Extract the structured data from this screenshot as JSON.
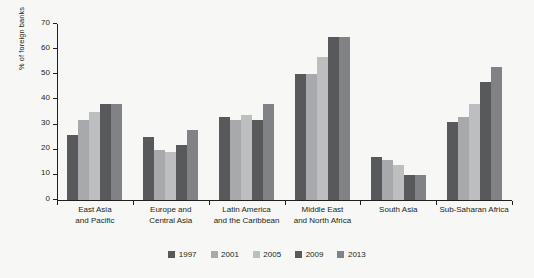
{
  "figure": {
    "title_remnant": "",
    "background_color": "#f7f7f5"
  },
  "chart_data": {
    "type": "bar",
    "title": "",
    "subtitle": "",
    "xlabel": "",
    "ylabel": "% of foreign banks",
    "ylim": [
      0,
      70
    ],
    "yticks": [
      0,
      10,
      20,
      30,
      40,
      50,
      60,
      70
    ],
    "grid": false,
    "legend_position": "bottom-center",
    "orientation": "vertical",
    "grouped": true,
    "categories": [
      "East Asia and Pacific",
      "Europe and Central Asia",
      "Latin America and the Caribbean",
      "Middle East and North Africa",
      "South Asia",
      "Sub-Saharan Africa"
    ],
    "category_lines": [
      [
        "East Asia",
        "and Pacific"
      ],
      [
        "Europe and",
        "Central Asia"
      ],
      [
        "Latin America",
        "and the Caribbean"
      ],
      [
        "Middle East",
        "and North Africa"
      ],
      [
        "South Asia",
        ""
      ],
      [
        "Sub-Saharan Africa",
        ""
      ]
    ],
    "series": [
      {
        "name": "1997",
        "color": "#58595b",
        "values": [
          26,
          25,
          33,
          50,
          17,
          31
        ]
      },
      {
        "name": "2001",
        "color": "#a7a9ac",
        "values": [
          32,
          20,
          32,
          50,
          16,
          33
        ]
      },
      {
        "name": "2005",
        "color": "#bcbec0",
        "values": [
          35,
          19,
          34,
          57,
          14,
          38
        ]
      },
      {
        "name": "2009",
        "color": "#58595b",
        "values": [
          38,
          22,
          32,
          65,
          10,
          47
        ]
      },
      {
        "name": "2013",
        "color": "#808285",
        "values": [
          38,
          28,
          38,
          65,
          10,
          53
        ]
      }
    ]
  }
}
